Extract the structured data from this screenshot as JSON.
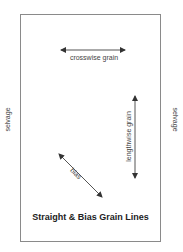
{
  "diagram": {
    "title": "Straight & Bias Grain Lines",
    "labels": {
      "crosswise": "crosswise grain",
      "lengthwise": "lengthwise grain",
      "bias": "bias",
      "selvage_left": "selvage",
      "selvage_right": "selvage"
    },
    "colors": {
      "border": "#8a8a8a",
      "arrow": "#333333",
      "text": "#444444",
      "title": "#222222"
    }
  }
}
